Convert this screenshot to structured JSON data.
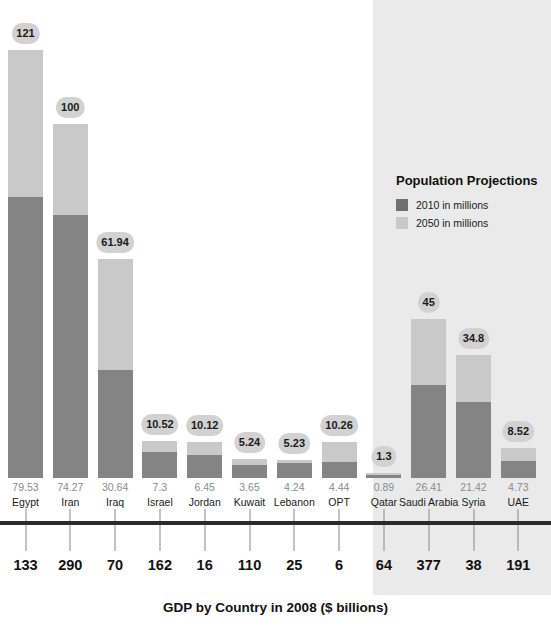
{
  "chart_data": {
    "type": "bar",
    "title": "",
    "xlabel": "GDP by Country in 2008 ($ billions)",
    "ylabel": "",
    "stacked": true,
    "grid": false,
    "legend_position": "right-inset",
    "legend_title": "Population Projections",
    "series": [
      {
        "name": "2010 in millions",
        "color": "#6f6f6f",
        "values": [
          79.53,
          74.27,
          30.64,
          7.3,
          6.45,
          3.65,
          4.24,
          4.44,
          0.89,
          26.41,
          21.42,
          4.73
        ]
      },
      {
        "name": "2050 in millions",
        "color": "#c9c9c9",
        "values": [
          121,
          100,
          61.94,
          10.52,
          10.12,
          5.24,
          5.23,
          10.26,
          1.3,
          45,
          34.8,
          8.52
        ]
      }
    ],
    "categories": [
      "Egypt",
      "Iran",
      "Iraq",
      "Israel",
      "Jordan",
      "Kuwait",
      "Lebanon",
      "OPT",
      "Qatar",
      "Saudi Arabia",
      "Syria",
      "UAE"
    ],
    "secondary_axis": {
      "label": "GDP by Country in 2008 ($ billions)",
      "values": [
        133,
        290,
        70,
        162,
        16,
        110,
        25,
        6,
        64,
        377,
        38,
        191
      ]
    },
    "ylim": [
      0,
      121
    ],
    "shaded_categories": [
      "Qatar",
      "Saudi Arabia",
      "Syria",
      "UAE"
    ]
  },
  "legend": {
    "title": "Population Projections",
    "items": [
      {
        "label": "2010 in millions",
        "color": "#6f6f6f"
      },
      {
        "label": "2050 in millions",
        "color": "#c9c9c9"
      }
    ]
  },
  "axis": {
    "title": "GDP by Country in 2008 ($ billions)"
  },
  "bars": [
    {
      "country": "Egypt",
      "pop2010": "79.53",
      "pop2050": "121",
      "gdp": "133",
      "v2010": 79.53,
      "v2050": 121,
      "shaded": false
    },
    {
      "country": "Iran",
      "pop2010": "74.27",
      "pop2050": "100",
      "gdp": "290",
      "v2010": 74.27,
      "v2050": 100,
      "shaded": false
    },
    {
      "country": "Iraq",
      "pop2010": "30.64",
      "pop2050": "61.94",
      "gdp": "70",
      "v2010": 30.64,
      "v2050": 61.94,
      "shaded": false
    },
    {
      "country": "Israel",
      "pop2010": "7.3",
      "pop2050": "10.52",
      "gdp": "162",
      "v2010": 7.3,
      "v2050": 10.52,
      "shaded": false
    },
    {
      "country": "Jordan",
      "pop2010": "6.45",
      "pop2050": "10.12",
      "gdp": "16",
      "v2010": 6.45,
      "v2050": 10.12,
      "shaded": false
    },
    {
      "country": "Kuwait",
      "pop2010": "3.65",
      "pop2050": "5.24",
      "gdp": "110",
      "v2010": 3.65,
      "v2050": 5.24,
      "shaded": false
    },
    {
      "country": "Lebanon",
      "pop2010": "4.24",
      "pop2050": "5.23",
      "gdp": "25",
      "v2010": 4.24,
      "v2050": 5.23,
      "shaded": false
    },
    {
      "country": "OPT",
      "pop2010": "4.44",
      "pop2050": "10.26",
      "gdp": "6",
      "v2010": 4.44,
      "v2050": 10.26,
      "shaded": false
    },
    {
      "country": "Qatar",
      "pop2010": "0.89",
      "pop2050": "1.3",
      "gdp": "64",
      "v2010": 0.89,
      "v2050": 1.3,
      "shaded": true
    },
    {
      "country": "Saudi Arabia",
      "pop2010": "26.41",
      "pop2050": "45",
      "gdp": "377",
      "v2010": 26.41,
      "v2050": 45,
      "shaded": true
    },
    {
      "country": "Syria",
      "pop2010": "21.42",
      "pop2050": "34.8",
      "gdp": "38",
      "v2010": 21.42,
      "v2050": 34.8,
      "shaded": true
    },
    {
      "country": "UAE",
      "pop2010": "4.73",
      "pop2050": "8.52",
      "gdp": "191",
      "v2010": 4.73,
      "v2050": 8.52,
      "shaded": true
    }
  ],
  "colors": {
    "pop2010": "#6f6f6f",
    "pop2050": "#c9c9c9",
    "shade": "#eaeaea",
    "axis": "#2b2b2b"
  }
}
